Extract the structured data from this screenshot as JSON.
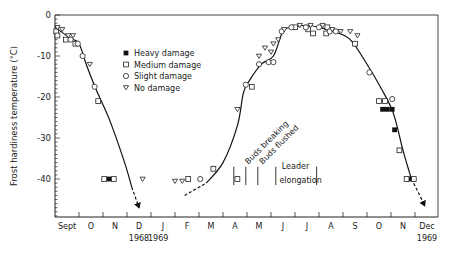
{
  "chart_data": {
    "type": "scatter",
    "title": "",
    "xlabel": "",
    "ylabel": "Frost hardiness temperature (°C)",
    "ylim": [
      -49,
      0
    ],
    "yticks": [
      0,
      -10,
      -20,
      -30,
      -40
    ],
    "ytick_labels": [
      "0",
      "-10",
      "-20",
      "-30",
      "-40"
    ],
    "x_unit": "months since 1 Sept 1968",
    "xlim": [
      0,
      16
    ],
    "x_month_labels": [
      "Sept",
      "O",
      "N",
      "D",
      "J",
      "F",
      "M",
      "A",
      "M",
      "J",
      "J",
      "A",
      "S",
      "O",
      "N",
      "Dec"
    ],
    "x_year_labels": [
      {
        "text": "1968",
        "month_pos": 3.5
      },
      {
        "text": "1969",
        "month_pos": 4.3
      },
      {
        "text": "1969",
        "month_pos": 15.5
      }
    ],
    "grid": false,
    "legend_position": "upper-left-center",
    "legend": [
      {
        "key": "heavy",
        "label": "Heavy damage",
        "marker": "filled-square"
      },
      {
        "key": "medium",
        "label": "Medium damage",
        "marker": "open-square"
      },
      {
        "key": "slight",
        "label": "Slight damage",
        "marker": "open-circle"
      },
      {
        "key": "none",
        "label": "No damage",
        "marker": "open-triangle-down"
      }
    ],
    "series": [
      {
        "name": "Heavy damage",
        "key": "heavy",
        "points": [
          [
            2.25,
            -40
          ],
          [
            13.65,
            -23
          ],
          [
            13.85,
            -23
          ],
          [
            14.05,
            -23
          ],
          [
            14.15,
            -28
          ],
          [
            14.75,
            -40
          ]
        ]
      },
      {
        "name": "Medium damage",
        "key": "medium",
        "points": [
          [
            0.05,
            -4
          ],
          [
            0.1,
            -5
          ],
          [
            0.45,
            -6
          ],
          [
            0.85,
            -7
          ],
          [
            1.8,
            -21
          ],
          [
            2.05,
            -40
          ],
          [
            2.45,
            -40
          ],
          [
            5.55,
            -40
          ],
          [
            6.6,
            -37.5
          ],
          [
            7.6,
            -40
          ],
          [
            8.2,
            -17.5
          ],
          [
            10.0,
            -3
          ],
          [
            10.55,
            -3.5
          ],
          [
            10.75,
            -4.5
          ],
          [
            11.3,
            -4.5
          ],
          [
            11.35,
            -3
          ],
          [
            12.5,
            -7
          ],
          [
            13.5,
            -21
          ],
          [
            13.75,
            -21
          ],
          [
            14.35,
            -33
          ],
          [
            14.65,
            -40
          ],
          [
            14.95,
            -40
          ]
        ]
      },
      {
        "name": "Slight damage",
        "key": "slight",
        "points": [
          [
            0.65,
            -6
          ],
          [
            0.95,
            -7
          ],
          [
            1.15,
            -10
          ],
          [
            1.65,
            -17.5
          ],
          [
            6.05,
            -40
          ],
          [
            7.95,
            -17
          ],
          [
            8.5,
            -12
          ],
          [
            8.9,
            -11.5
          ],
          [
            9.1,
            -11.5
          ],
          [
            9.45,
            -4
          ],
          [
            9.85,
            -3
          ],
          [
            10.45,
            -3
          ],
          [
            11.0,
            -3
          ],
          [
            11.45,
            -4
          ],
          [
            11.7,
            -4
          ],
          [
            13.1,
            -14
          ],
          [
            14.05,
            -20.5
          ]
        ]
      },
      {
        "name": "No damage",
        "key": "none",
        "points": [
          [
            0.1,
            -3
          ],
          [
            0.3,
            -3.5
          ],
          [
            0.55,
            -5
          ],
          [
            0.75,
            -5
          ],
          [
            1.45,
            -12
          ],
          [
            3.65,
            -40
          ],
          [
            5.0,
            -40.5
          ],
          [
            5.3,
            -40.5
          ],
          [
            7.6,
            -23
          ],
          [
            8.5,
            -10
          ],
          [
            8.75,
            -8
          ],
          [
            9.0,
            -9
          ],
          [
            9.1,
            -7
          ],
          [
            9.55,
            -3.5
          ],
          [
            9.3,
            -6
          ],
          [
            10.2,
            -2.5
          ],
          [
            10.65,
            -2.5
          ],
          [
            11.15,
            -2.5
          ],
          [
            11.55,
            -3.5
          ],
          [
            11.9,
            -4
          ],
          [
            12.3,
            -4
          ],
          [
            12.6,
            -5
          ]
        ]
      }
    ],
    "curves": [
      {
        "name": "autumn-1968",
        "style": "solid",
        "points": [
          [
            0.0,
            -3
          ],
          [
            0.6,
            -5.5
          ],
          [
            1.0,
            -7
          ],
          [
            1.3,
            -12
          ],
          [
            1.7,
            -18
          ],
          [
            2.3,
            -26
          ],
          [
            2.9,
            -36
          ],
          [
            3.2,
            -42
          ]
        ]
      },
      {
        "name": "autumn-1968-extrapolated",
        "style": "dashed-arrow",
        "points": [
          [
            3.2,
            -42
          ],
          [
            3.5,
            -47
          ]
        ]
      },
      {
        "name": "spring-summer-1969",
        "style": "solid",
        "points": [
          [
            6.3,
            -41
          ],
          [
            7.0,
            -36
          ],
          [
            7.6,
            -27
          ],
          [
            7.85,
            -19
          ],
          [
            8.1,
            -16
          ],
          [
            8.6,
            -12
          ],
          [
            9.1,
            -10
          ],
          [
            9.5,
            -4
          ],
          [
            9.9,
            -3
          ],
          [
            10.5,
            -2.5
          ],
          [
            11.0,
            -3
          ],
          [
            11.6,
            -4
          ],
          [
            12.3,
            -6
          ],
          [
            13.0,
            -12
          ],
          [
            13.6,
            -18
          ],
          [
            14.1,
            -24
          ],
          [
            14.5,
            -33
          ],
          [
            14.85,
            -40
          ]
        ]
      },
      {
        "name": "spring-1969-extrapolated",
        "style": "dashed",
        "points": [
          [
            5.4,
            -44
          ],
          [
            6.3,
            -41
          ]
        ]
      },
      {
        "name": "autumn-1969-extrapolated",
        "style": "dashed-arrow",
        "points": [
          [
            14.85,
            -40
          ],
          [
            15.2,
            -44
          ],
          [
            15.4,
            -46.5
          ]
        ]
      }
    ],
    "annotations": [
      {
        "text": "Buds breaking",
        "month_pos": 8.05,
        "angle": -45
      },
      {
        "text": "Buds flushed",
        "month_pos": 8.65,
        "angle": -45
      },
      {
        "text": "Leader",
        "month_pos": 9.45
      },
      {
        "text": "elongation",
        "month_pos": 9.35
      }
    ],
    "phenology_markers": [
      7.45,
      7.95,
      8.45,
      9.2,
      10.9
    ]
  }
}
